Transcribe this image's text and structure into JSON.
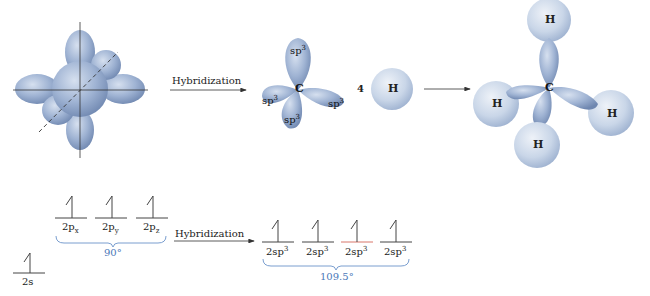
{
  "diagram": {
    "colors": {
      "orbital_fill": "#9fb3d3",
      "orbital_dark": "#7f96bd",
      "hydrogen_fill": "#c9d6e8",
      "angle_text": "#4a78b8",
      "bracket": "#6b93c9",
      "highlight_line": "#d9776a",
      "line": "#555555"
    },
    "top_row": {
      "unhybridized": {
        "description": "s and p orbitals on axes"
      },
      "arrow1_label": "Hybridization",
      "carbon_label": "C",
      "lobes": [
        {
          "label": "sp",
          "sup": "3"
        },
        {
          "label": "sp",
          "sup": "3"
        },
        {
          "label": "sp",
          "sup": "3"
        },
        {
          "label": "sp",
          "sup": "3"
        }
      ],
      "coefficient": "4",
      "hydrogen_label": "H",
      "methane": {
        "carbon_label": "C",
        "hydrogens": [
          "H",
          "H",
          "H",
          "H"
        ]
      }
    },
    "bottom_row": {
      "ground_state": {
        "s_orbital": {
          "label": "2s"
        },
        "p_orbitals": [
          {
            "label": "2p",
            "sub": "x"
          },
          {
            "label": "2p",
            "sub": "y"
          },
          {
            "label": "2p",
            "sub": "z"
          }
        ],
        "angle": "90°"
      },
      "arrow_label": "Hybridization",
      "hybrid": {
        "orbitals": [
          {
            "label": "2sp",
            "sup": "3"
          },
          {
            "label": "2sp",
            "sup": "3"
          },
          {
            "label": "2sp",
            "sup": "3"
          },
          {
            "label": "2sp",
            "sup": "3"
          }
        ],
        "angle": "109.5°"
      }
    }
  }
}
